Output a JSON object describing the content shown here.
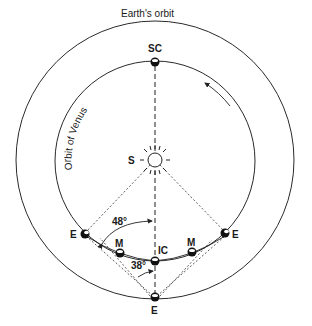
{
  "diagram": {
    "labels": {
      "earth_orbit": "Earth's orbit",
      "venus_orbit": "Orbit of Venus",
      "superior_conjunction": "SC",
      "sun": "S",
      "inferior_conjunction": "IC",
      "earth_left": "E",
      "earth_right": "E",
      "earth_bottom": "E",
      "mercury_left": "M",
      "mercury_right": "M",
      "angle_elongation": "48°",
      "angle_small": "38°"
    },
    "geometry": {
      "center": [
        155,
        160
      ],
      "earth_orbit_radius": 138,
      "venus_orbit_radius": 100
    },
    "colors": {
      "line": "#2a2a2a",
      "background": "#ffffff"
    }
  }
}
